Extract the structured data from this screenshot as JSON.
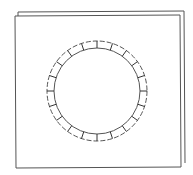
{
  "drawing": {
    "description": "Line sketch of a square plate with a circular ring of segments",
    "stroke_color": "#555555",
    "background": "#ffffff",
    "back_sheet": {
      "x1": 18,
      "y1": 12,
      "x2": 184,
      "y2": 163
    },
    "front_sheet": {
      "x1": 15,
      "y1": 16,
      "x2": 180,
      "y2": 167
    },
    "ring": {
      "cx": 97,
      "cy": 91,
      "outer_r": 50,
      "inner_r": 43,
      "segments": 20
    }
  }
}
